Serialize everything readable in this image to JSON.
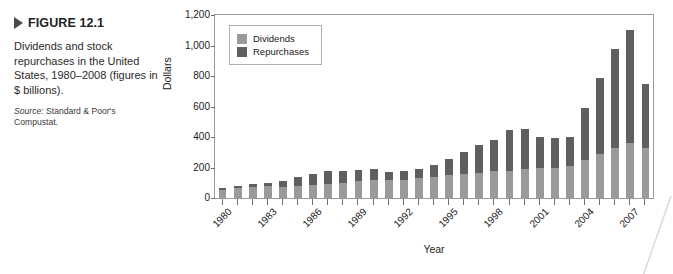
{
  "figure": {
    "marker_icon": "triangle-right-icon",
    "title": "FIGURE 12.1",
    "caption": "Dividends and stock repurchases in the United States, 1980–2008 (figures in $ billions).",
    "source_label": "Source:",
    "source_text": " Standard & Poor's Compustat."
  },
  "legend": {
    "items": [
      {
        "label": "Dividends",
        "color": "#9a9a9a"
      },
      {
        "label": "Repurchases",
        "color": "#5f5f5f"
      }
    ]
  },
  "colors": {
    "dividends": "#9a9a9a",
    "repurchases": "#5f5f5f",
    "frame": "#9b9b9b"
  },
  "chart_data": {
    "type": "bar",
    "subtype": "stacked",
    "title": "",
    "xlabel": "Year",
    "ylabel": "Dollars",
    "ylim": [
      0,
      1200
    ],
    "yticks": [
      0,
      200,
      400,
      600,
      800,
      1000,
      1200
    ],
    "ytick_labels": [
      "0",
      "200",
      "400",
      "600",
      "800",
      "1,000",
      "1,200"
    ],
    "grid": false,
    "legend_position": "top-left-inside",
    "categories": [
      "1980",
      "1981",
      "1982",
      "1983",
      "1984",
      "1985",
      "1986",
      "1987",
      "1988",
      "1989",
      "1990",
      "1991",
      "1992",
      "1993",
      "1994",
      "1995",
      "1996",
      "1997",
      "1998",
      "1999",
      "2000",
      "2001",
      "2002",
      "2003",
      "2004",
      "2005",
      "2006",
      "2007",
      "2008"
    ],
    "xtick_labels": [
      "1980",
      "1983",
      "1986",
      "1989",
      "1992",
      "1995",
      "1998",
      "2001",
      "2004",
      "2007"
    ],
    "series": [
      {
        "name": "Dividends",
        "color": "#9a9a9a",
        "values": [
          55,
          65,
          70,
          78,
          70,
          80,
          85,
          95,
          100,
          110,
          120,
          118,
          120,
          128,
          135,
          150,
          160,
          165,
          175,
          180,
          190,
          195,
          200,
          210,
          250,
          290,
          330,
          360,
          330
        ]
      },
      {
        "name": "Repurchases",
        "color": "#5f5f5f",
        "values": [
          10,
          15,
          25,
          22,
          40,
          60,
          75,
          85,
          80,
          75,
          70,
          52,
          55,
          62,
          80,
          105,
          140,
          180,
          205,
          265,
          260,
          205,
          195,
          190,
          340,
          500,
          645,
          740,
          420
        ]
      }
    ],
    "totals": [
      65,
      80,
      95,
      100,
      110,
      140,
      160,
      180,
      180,
      185,
      190,
      170,
      175,
      190,
      215,
      255,
      300,
      345,
      380,
      445,
      450,
      400,
      395,
      400,
      590,
      790,
      975,
      1100,
      750
    ]
  }
}
